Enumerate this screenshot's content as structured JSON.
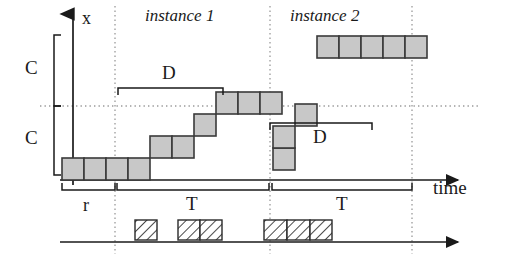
{
  "figure": {
    "type": "timing-diagram",
    "background": "#ffffff",
    "ink": "#1a1a1a",
    "block_fill": "#c8c8c8",
    "block_stroke": "#3a3a3a",
    "dotted_color": "#9a9a9a"
  },
  "axes": {
    "y_label": "x",
    "x_label": "time",
    "y_axis": {
      "x": 73,
      "y_top": 14,
      "y_bottom": 185,
      "arrow": "up"
    },
    "time_axis": {
      "y": 180,
      "x_start": 60,
      "x_end": 458,
      "arrow": "right"
    },
    "event_axis": {
      "y": 242,
      "x_start": 60,
      "x_end": 458,
      "arrow": "right"
    },
    "reference_line_y": 106,
    "guides_x": [
      115,
      270,
      412
    ]
  },
  "titles": {
    "instance_1": "instance 1",
    "instance_2": "instance 2"
  },
  "brackets": {
    "c_upper": {
      "label": "C",
      "x": 54,
      "y_top": 35,
      "y_bottom": 106,
      "orientation": "vertical"
    },
    "c_lower": {
      "label": "C",
      "y_top": 106,
      "y_bottom": 175,
      "x": 54,
      "orientation": "vertical"
    },
    "d_first": {
      "label": "D",
      "x_start": 118,
      "x_end": 223,
      "y": 88,
      "orientation": "horizontal-down"
    },
    "d_second": {
      "label": "D",
      "x_start": 270,
      "x_end": 372,
      "y": 123,
      "orientation": "horizontal-down"
    },
    "r": {
      "label": "r",
      "x_start": 62,
      "x_end": 115,
      "y": 190,
      "orientation": "horizontal-up"
    },
    "t_first": {
      "label": "T",
      "x_start": 117,
      "x_end": 269,
      "y": 190,
      "orientation": "horizontal-up"
    },
    "t_second": {
      "label": "T",
      "x_start": 272,
      "x_end": 412,
      "y": 190,
      "orientation": "horizontal-up"
    }
  },
  "chart_data": {
    "type": "step",
    "title": "",
    "xlabel": "time",
    "ylabel": "x",
    "block_size": 22,
    "progress_blocks": [
      {
        "x": 62,
        "y": 158,
        "row": 0
      },
      {
        "x": 84,
        "y": 158,
        "row": 0
      },
      {
        "x": 106,
        "y": 158,
        "row": 0
      },
      {
        "x": 128,
        "y": 158,
        "row": 0
      },
      {
        "x": 150,
        "y": 136,
        "row": 1
      },
      {
        "x": 172,
        "y": 136,
        "row": 1
      },
      {
        "x": 194,
        "y": 114,
        "row": 2
      },
      {
        "x": 216,
        "y": 92,
        "row": 3
      },
      {
        "x": 238,
        "y": 92,
        "row": 3
      },
      {
        "x": 260,
        "y": 92,
        "row": 3
      },
      {
        "x": 273,
        "y": 148,
        "row": -1
      },
      {
        "x": 273,
        "y": 126,
        "row": -1
      },
      {
        "x": 295,
        "y": 104,
        "row": -1
      },
      {
        "x": 317,
        "y": 36,
        "row": 5
      },
      {
        "x": 339,
        "y": 36,
        "row": 5
      },
      {
        "x": 361,
        "y": 36,
        "row": 5
      },
      {
        "x": 383,
        "y": 36,
        "row": 5
      },
      {
        "x": 405,
        "y": 36,
        "row": 5
      }
    ],
    "execution_blocks": [
      {
        "x": 135,
        "y": 220,
        "w": 22,
        "h": 20
      },
      {
        "x": 178,
        "y": 220,
        "w": 22,
        "h": 20
      },
      {
        "x": 200,
        "y": 220,
        "w": 22,
        "h": 20
      },
      {
        "x": 264,
        "y": 220,
        "w": 23,
        "h": 20
      },
      {
        "x": 287,
        "y": 220,
        "w": 23,
        "h": 20
      },
      {
        "x": 310,
        "y": 220,
        "w": 22,
        "h": 20
      }
    ]
  }
}
